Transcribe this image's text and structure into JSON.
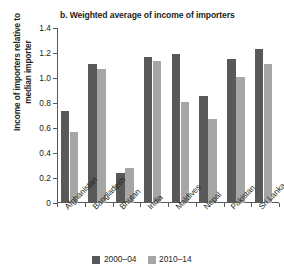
{
  "chart_data": {
    "type": "bar",
    "title": "b. Weighted average of income of importers",
    "xlabel": "",
    "ylabel": "Income of importers relative to\nmedian importer",
    "ylim": [
      0,
      1.4
    ],
    "ytick_labels": [
      "0",
      "0.2",
      "0.4",
      "0.6",
      "0.8",
      "1.0",
      "1.2",
      "1.4"
    ],
    "ytick_values": [
      0,
      0.2,
      0.4,
      0.6,
      0.8,
      1.0,
      1.2,
      1.4
    ],
    "grid": false,
    "legend_position": "bottom-center",
    "categories": [
      "Afghanistan",
      "Bangladesh",
      "Bhutan",
      "India",
      "Maldives",
      "Nepal",
      "Pakistan",
      "Sri Lanka"
    ],
    "series": [
      {
        "name": "2000–04",
        "color": "#595959",
        "values": [
          0.74,
          1.11,
          0.24,
          1.17,
          1.19,
          0.86,
          1.15,
          1.23
        ]
      },
      {
        "name": "2010–14",
        "color": "#a6a6a6",
        "values": [
          0.57,
          1.07,
          0.28,
          1.14,
          0.81,
          0.67,
          1.01,
          1.11
        ]
      }
    ]
  },
  "colors": {
    "series_2000_04": "#595959",
    "series_2010_14": "#a6a6a6",
    "axis": "#58595b",
    "text": "#231f20",
    "background": "#ffffff"
  }
}
